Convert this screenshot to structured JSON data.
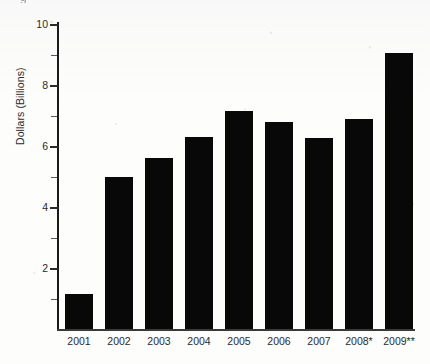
{
  "chart_data": {
    "type": "bar",
    "title": "",
    "xlabel": "",
    "ylabel": "Dollars (Billions)",
    "categories": [
      "2001",
      "2002",
      "2003",
      "2004",
      "2005",
      "2006",
      "2007",
      "2008*",
      "2009**"
    ],
    "values": [
      1.15,
      5.0,
      5.6,
      6.3,
      7.15,
      6.8,
      6.25,
      6.9,
      9.05
    ],
    "ylim": [
      0,
      10
    ],
    "y_major_ticks": [
      2,
      4,
      6,
      8,
      10
    ],
    "y_tick_labels": [
      "2",
      "4",
      "6",
      "8",
      "10"
    ],
    "y_minor_ticks": [
      1,
      3,
      5,
      7,
      9
    ],
    "grid": false,
    "legend": null,
    "bar_color": "#080808",
    "axis_color": "#1a1a1a",
    "background_color": "#fdfdfc"
  },
  "axes": {
    "y_title": "Dollars (Billions)",
    "y_labels": [
      "10",
      "8",
      "6",
      "4",
      "2"
    ],
    "x_labels": [
      "2001",
      "2002",
      "2003",
      "2004",
      "2005",
      "2006",
      "2007",
      "2008*",
      "2009**"
    ]
  },
  "annotations": {
    "caption_fragment": "g"
  }
}
